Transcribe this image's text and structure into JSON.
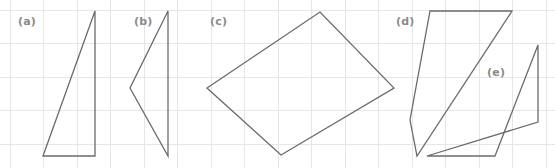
{
  "figure": {
    "width": 555,
    "height": 168,
    "background_color": "#ffffff",
    "grid": {
      "visible": true,
      "color": "#e6e6ea",
      "spacing_px": 33.5,
      "x_positions": [
        10,
        43.5,
        77,
        110.5,
        144,
        177.5,
        211,
        244.5,
        278,
        311.5,
        345,
        378.5,
        412,
        445.5,
        479,
        512.5,
        546
      ],
      "y_positions": [
        10,
        43.5,
        77,
        110.5,
        144
      ]
    },
    "stroke_color": "#6b6b6b",
    "label_color": "#8a8a8a",
    "shapes": [
      {
        "id": "a",
        "label": "(a)",
        "label_x": 18,
        "label_y": 16,
        "kind": "right-triangle",
        "points": "43,156 95,11 95,156",
        "vertices": [
          [
            43,
            156
          ],
          [
            95,
            11
          ],
          [
            95,
            156
          ]
        ]
      },
      {
        "id": "b",
        "label": "(b)",
        "label_x": 134,
        "label_y": 16,
        "kind": "triangle-pointing-left",
        "points": "168,11 130,88 168,156",
        "vertices": [
          [
            168,
            11
          ],
          [
            130,
            88
          ],
          [
            168,
            156
          ]
        ]
      },
      {
        "id": "c",
        "label": "(c)",
        "label_x": 210,
        "label_y": 16,
        "kind": "quadrilateral",
        "points": "207,88 320,12 394,88 281,155",
        "vertices": [
          [
            207,
            88
          ],
          [
            320,
            12
          ],
          [
            394,
            88
          ],
          [
            281,
            155
          ]
        ]
      },
      {
        "id": "d",
        "label": "(d)",
        "label_x": 396,
        "label_y": 16,
        "kind": "quadrilateral",
        "points": "430,11 512,11 417,156 410,120",
        "vertices": [
          [
            430,
            11
          ],
          [
            512,
            11
          ],
          [
            417,
            156
          ],
          [
            410,
            120
          ]
        ]
      },
      {
        "id": "e",
        "label": "(e)",
        "label_x": 487,
        "label_y": 67,
        "kind": "parallelogram",
        "points": "495,156 538,45 538,122 427,156",
        "vertices": [
          [
            495,
            156
          ],
          [
            538,
            45
          ],
          [
            538,
            122
          ],
          [
            427,
            156
          ]
        ]
      }
    ]
  }
}
